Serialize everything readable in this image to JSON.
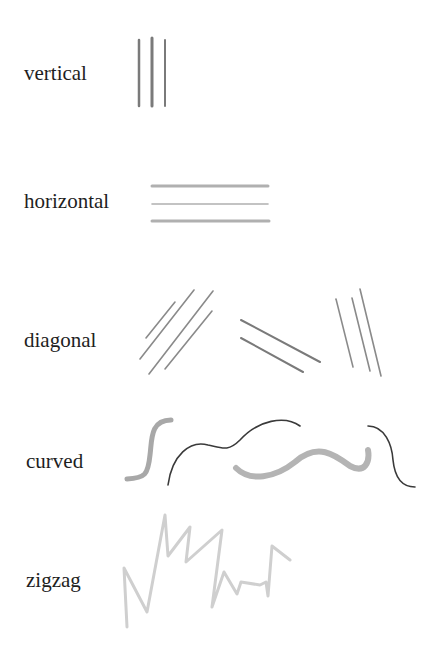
{
  "diagram": {
    "rows": [
      {
        "label": "vertical",
        "color": "#7a7a7a"
      },
      {
        "label": "horizontal",
        "color": "#b0b0b0"
      },
      {
        "label": "diagonal",
        "color": "#8a8a8a"
      },
      {
        "label": "curved",
        "color_thick": "#b4b4b4",
        "color_thin": "#3a3a3a"
      },
      {
        "label": "zigzag",
        "color": "#cfcfcf"
      }
    ]
  }
}
